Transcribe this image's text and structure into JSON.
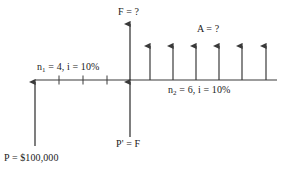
{
  "diagram": {
    "type": "cash-flow-timeline",
    "colors": {
      "line": "#3a3a3a",
      "text": "#1a1a1a",
      "background": "#ffffff"
    },
    "labels": {
      "future_value": "F = ?",
      "annuity": "A = ?",
      "period_one": "n₁ = 4, i = 10%",
      "period_one_parts": {
        "symbol": "n",
        "subscript": "1",
        "rest": " = 4, i = 10%"
      },
      "period_two": "n₂ = 6, i = 10%",
      "period_two_parts": {
        "symbol": "n",
        "subscript": "2",
        "rest": " = 6, i = 10%"
      },
      "present_prime": "P' = F",
      "present_value": "P = $100,000"
    },
    "values": {
      "n1": 4,
      "n2": 6,
      "interest_rate": "10%",
      "principal": "$100,000",
      "unknown_future": "?",
      "unknown_annuity": "?"
    },
    "timeline": {
      "baseline_y": 80,
      "x_start": 35,
      "x_end": 277,
      "tick_positions": [
        59,
        83,
        107
      ],
      "origin_x": 35,
      "midpoint_x": 130
    },
    "arrows": {
      "principal_inflow": {
        "x": 35,
        "from_y": 146,
        "to_y": 80,
        "direction": "up"
      },
      "future_up": {
        "x": 130,
        "from_y": 80,
        "to_y": 22,
        "direction": "up"
      },
      "prime_up": {
        "x": 130,
        "from_y": 138,
        "to_y": 80,
        "direction": "up"
      },
      "annuity_series_x": [
        150,
        173,
        196,
        219,
        242,
        266
      ],
      "annuity_from_y": 80,
      "annuity_to_y": 45
    }
  }
}
